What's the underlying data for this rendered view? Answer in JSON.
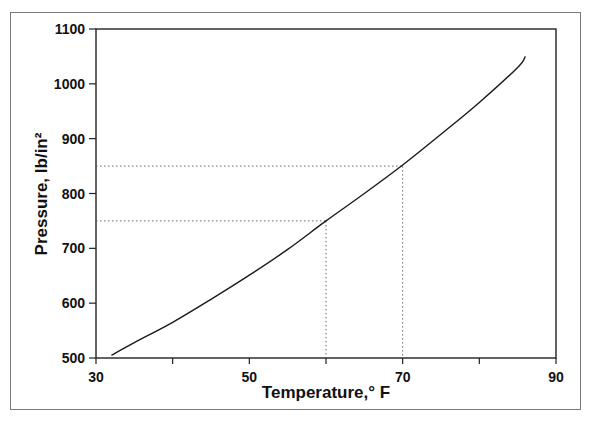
{
  "chart_data": {
    "type": "line",
    "title": "",
    "xlabel": "Temperature,° F",
    "ylabel": "Pressure, lb/in²",
    "xlim": [
      30,
      90
    ],
    "ylim": [
      500,
      1100
    ],
    "x_ticks": [
      30,
      40,
      50,
      60,
      70,
      80,
      90
    ],
    "x_tick_labels": [
      "30",
      "",
      "50",
      "",
      "70",
      "",
      "90"
    ],
    "y_ticks": [
      500,
      600,
      700,
      800,
      900,
      1000,
      1100
    ],
    "y_tick_labels": [
      "500",
      "600",
      "700",
      "800",
      "900",
      "1000",
      "1100"
    ],
    "grid": false,
    "legend": null,
    "series": [
      {
        "name": "Pressure vs Temperature",
        "x": [
          32,
          35,
          40,
          45,
          50,
          55,
          60,
          65,
          70,
          75,
          80,
          85,
          86
        ],
        "y": [
          505,
          528,
          565,
          607,
          651,
          698,
          750,
          800,
          852,
          908,
          966,
          1030,
          1050
        ]
      }
    ],
    "reference_lines": [
      {
        "type": "dotted",
        "x": 60,
        "y": 750
      },
      {
        "type": "dotted",
        "x": 70,
        "y": 850
      }
    ]
  }
}
